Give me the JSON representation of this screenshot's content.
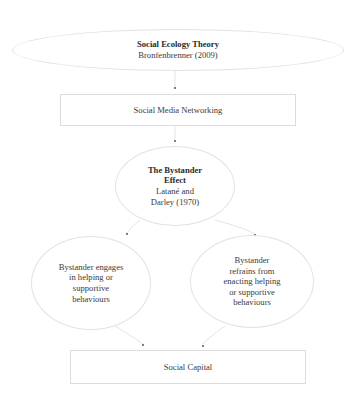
{
  "diagram": {
    "nodes": {
      "theory": {
        "title": "Social Ecology Theory",
        "subtitle": "Bronfenbrenner (2009)"
      },
      "social_media": {
        "label": "Social Media Networking"
      },
      "bystander": {
        "title_line1": "The Bystander",
        "title_line2": "Effect",
        "sub_line1": "Latané and",
        "sub_line2": "Darley (1970)"
      },
      "engages": {
        "lines": [
          "Bystander engages",
          "in helping or",
          "supportive",
          "behaviours"
        ]
      },
      "refrains": {
        "lines": [
          "Bystander",
          "refrains from",
          "enacting helping",
          "or supportive",
          "behaviours"
        ]
      },
      "social_capital": {
        "label": "Social Capital"
      }
    },
    "edges": [
      {
        "from": "theory",
        "to": "social_media"
      },
      {
        "from": "social_media",
        "to": "bystander"
      },
      {
        "from": "bystander",
        "to": "engages"
      },
      {
        "from": "bystander",
        "to": "refrains"
      },
      {
        "from": "engages",
        "to": "social_capital"
      },
      {
        "from": "refrains",
        "to": "social_capital"
      }
    ],
    "colors": {
      "outline": "#e2e2e2",
      "text": "#3a3a3a",
      "arrow": "#555555"
    }
  }
}
